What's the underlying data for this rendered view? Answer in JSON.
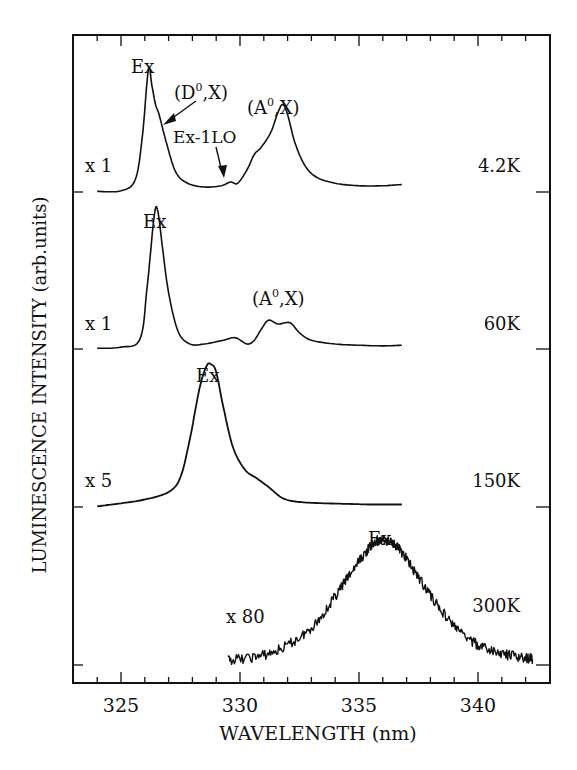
{
  "chart_data": {
    "type": "line",
    "title": "",
    "xlabel": "WAVELENGTH (nm)",
    "ylabel": "LUMINESCENCE INTENSITY (arb.units)",
    "xlim": [
      323,
      343
    ],
    "xticks": [
      325,
      330,
      335,
      340
    ],
    "xtick_labels": [
      "325",
      "330",
      "335",
      "340"
    ],
    "minor_xtick_step": 1,
    "grid": false,
    "stacked_offset": true,
    "series": [
      {
        "name": "4.2K",
        "temperature_label": "4.2K",
        "multiplier_label": "x 1",
        "noisy": false,
        "baseline_y": 192,
        "scale": 1,
        "x": [
          324.0,
          325.0,
          325.6,
          325.9,
          326.15,
          326.3,
          326.45,
          326.6,
          326.9,
          327.3,
          327.8,
          328.5,
          329.2,
          329.6,
          329.9,
          330.3,
          330.6,
          330.9,
          331.3,
          331.6,
          331.8,
          332.0,
          332.3,
          332.7,
          333.2,
          334.0,
          335.0,
          336.0,
          336.8
        ],
        "y": [
          0.5,
          1.0,
          10,
          45,
          98,
          85,
          70,
          62,
          40,
          16,
          7,
          4,
          5,
          8,
          7,
          18,
          30,
          36,
          48,
          64,
          70,
          62,
          40,
          22,
          12,
          7,
          5,
          5,
          6
        ],
        "peak_labels": [
          {
            "text": "Ex",
            "x_nm": 326.2
          },
          {
            "text": "(D0,X)",
            "x_nm": 327.3,
            "arrow_to_nm": 326.55
          },
          {
            "text": "Ex-1LO",
            "x_nm": 329.3,
            "arrow_to_nm": 329.6
          },
          {
            "text": "(A0,X)",
            "x_nm": 331.9
          }
        ]
      },
      {
        "name": "60K",
        "temperature_label": "60K",
        "multiplier_label": "x 1",
        "noisy": false,
        "baseline_y": 349,
        "scale": 1,
        "x": [
          324.0,
          325.0,
          325.8,
          326.1,
          326.4,
          326.55,
          326.75,
          327.0,
          327.4,
          327.9,
          328.5,
          329.3,
          329.8,
          330.3,
          330.6,
          330.9,
          331.2,
          331.6,
          332.1,
          332.5,
          333.0,
          334.0,
          335.0,
          336.0,
          336.8
        ],
        "y": [
          0.5,
          1.5,
          8,
          50,
          107,
          110,
          80,
          45,
          14,
          4,
          4,
          7,
          9,
          4,
          7,
          16,
          23,
          20,
          21,
          13,
          7,
          4,
          3,
          2.5,
          3
        ],
        "peak_labels": [
          {
            "text": "Ex",
            "x_nm": 326.5
          },
          {
            "text": "(A0,X)",
            "x_nm": 331.8
          }
        ]
      },
      {
        "name": "150K",
        "temperature_label": "150K",
        "multiplier_label": "x 5",
        "noisy": false,
        "baseline_y": 507,
        "scale": 1,
        "x": [
          324.0,
          325.0,
          326.0,
          327.0,
          327.5,
          327.9,
          328.3,
          328.6,
          328.8,
          329.0,
          329.3,
          329.7,
          330.2,
          330.7,
          331.2,
          331.8,
          332.5,
          333.5,
          334.5,
          335.5,
          336.8
        ],
        "y": [
          0.5,
          3,
          6,
          12,
          24,
          55,
          95,
          113,
          114,
          108,
          80,
          48,
          30,
          23,
          16,
          7,
          4,
          3,
          2.5,
          2,
          2
        ],
        "peak_labels": [
          {
            "text": "Ex",
            "x_nm": 328.8
          }
        ]
      },
      {
        "name": "300K",
        "temperature_label": "300K",
        "multiplier_label": "x 80",
        "noisy": true,
        "baseline_y": 665,
        "scale": 1,
        "x": [
          329.5,
          330.5,
          331.5,
          332.5,
          333.3,
          334.0,
          334.6,
          335.2,
          335.6,
          336.0,
          336.4,
          336.8,
          337.3,
          338.0,
          338.7,
          339.4,
          340.2,
          341.0,
          341.8,
          342.3
        ],
        "y": [
          4,
          6,
          11,
          22,
          36,
          55,
          72,
          88,
          97,
          100,
          98,
          90,
          76,
          56,
          38,
          24,
          14,
          9,
          6,
          5
        ],
        "peak_labels": [
          {
            "text": "Ex",
            "x_nm": 336.1
          }
        ]
      }
    ]
  },
  "axes": {
    "xlabel": "WAVELENGTH (nm)",
    "ylabel": "LUMINESCENCE INTENSITY (arb.units)",
    "xtick_labels": [
      "325",
      "330",
      "335",
      "340"
    ]
  },
  "annotations": {
    "s1_ex": "Ex",
    "s1_d0x_main": "(D",
    "s1_d0x_sup": "0",
    "s1_d0x_end": ",X)",
    "s1_ex1lo": "Ex-1LO",
    "s1_a0x_main": "(A",
    "s1_a0x_sup": "0",
    "s1_a0x_end": ",X)",
    "s2_ex": "Ex",
    "s2_a0x_main": "(A",
    "s2_a0x_sup": "0",
    "s2_a0x_end": ",X)",
    "s3_ex": "Ex",
    "s4_ex": "Ex"
  },
  "colors": {
    "ink": "#111111",
    "background": "#ffffff"
  }
}
